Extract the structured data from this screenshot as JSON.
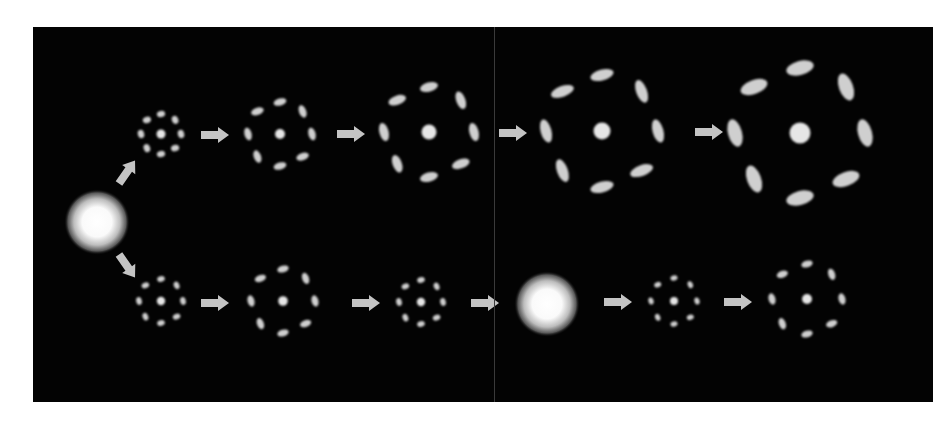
{
  "figure": {
    "background": "#030303",
    "foreground": "#e6e6e6",
    "arrow_color": "#c4c4c4",
    "panels": 2
  },
  "sources": [
    {
      "id": "origin-glow",
      "x": 64,
      "y": 195,
      "r": 33
    },
    {
      "id": "reset-glow",
      "x": 514,
      "y": 277,
      "r": 33
    }
  ],
  "rows": {
    "top": {
      "stages": [
        {
          "x": 128,
          "y": 107,
          "r": 20,
          "blob": 3.2,
          "core": 4.5,
          "elong": 1.3
        },
        {
          "x": 247,
          "y": 107,
          "r": 32,
          "blob": 3.6,
          "core": 5.0,
          "elong": 1.8
        },
        {
          "x": 396,
          "y": 105,
          "r": 45,
          "blob": 4.6,
          "core": 7.5,
          "elong": 2.0
        },
        {
          "x": 569,
          "y": 104,
          "r": 56,
          "blob": 5.4,
          "core": 8.5,
          "elong": 2.2
        },
        {
          "x": 767,
          "y": 106,
          "r": 65,
          "blob": 7.0,
          "core": 10.5,
          "elong": 2.0
        }
      ],
      "arrows": [
        {
          "x": 182,
          "y": 108
        },
        {
          "x": 318,
          "y": 107
        },
        {
          "x": 480,
          "y": 106
        },
        {
          "x": 676,
          "y": 105
        }
      ]
    },
    "bottom": {
      "stages": [
        {
          "x": 128,
          "y": 274,
          "r": 22,
          "blob": 2.8,
          "core": 4.2,
          "elong": 1.4
        },
        {
          "x": 250,
          "y": 274,
          "r": 32,
          "blob": 3.4,
          "core": 4.8,
          "elong": 1.7
        },
        {
          "x": 388,
          "y": 275,
          "r": 22,
          "blob": 2.8,
          "core": 4.2,
          "elong": 1.4
        },
        {
          "x": 641,
          "y": 274,
          "r": 23,
          "blob": 2.6,
          "core": 4.0,
          "elong": 1.4
        },
        {
          "x": 774,
          "y": 272,
          "r": 35,
          "blob": 3.4,
          "core": 5.0,
          "elong": 1.7
        }
      ],
      "arrows": [
        {
          "x": 182,
          "y": 276
        },
        {
          "x": 333,
          "y": 276
        },
        {
          "x": 452,
          "y": 276
        },
        {
          "x": 585,
          "y": 275
        },
        {
          "x": 705,
          "y": 275
        }
      ]
    },
    "branch_arrows": [
      {
        "x": 94,
        "y": 145,
        "angle": -55
      },
      {
        "x": 94,
        "y": 239,
        "angle": 55
      }
    ]
  }
}
